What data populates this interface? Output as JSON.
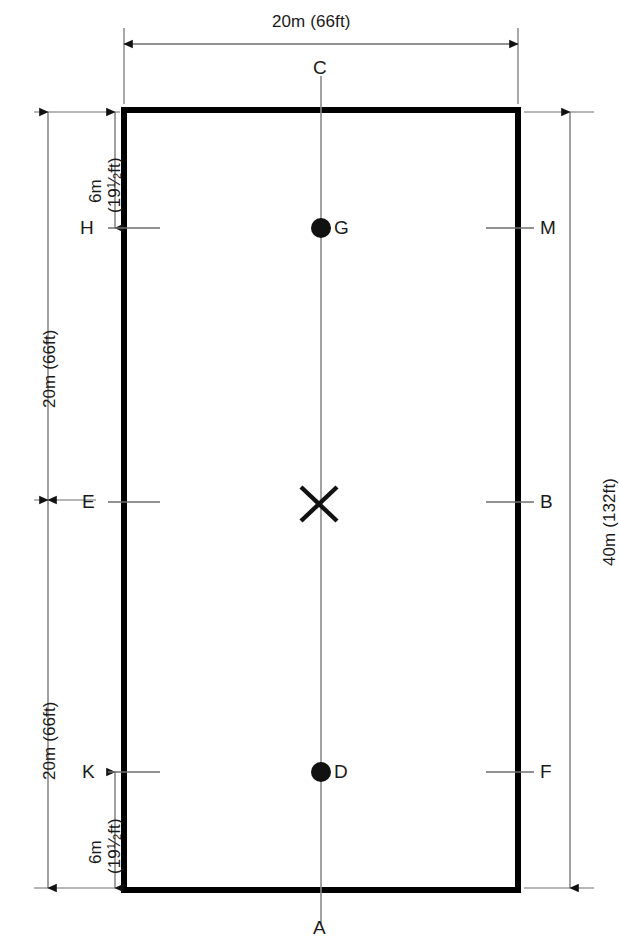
{
  "diagram": {
    "type": "dressage-arena-plan",
    "arena": {
      "width_label": "20m (66ft)",
      "height_label": "40m (132ft)"
    },
    "dimensions": {
      "top_width": "20m (66ft)",
      "right_height": "40m (132ft)",
      "upper_half": "20m (66ft)",
      "lower_half": "20m (66ft)",
      "top_inset_m": "6m",
      "top_inset_ft": "(19½ft)",
      "bottom_inset_m": "6m",
      "bottom_inset_ft": "(19½ft)"
    },
    "markers": {
      "top_center": "C",
      "bottom_center": "A",
      "left_upper": "H",
      "right_upper": "M",
      "left_middle": "E",
      "right_middle": "B",
      "left_lower": "K",
      "right_lower": "F",
      "center_cross": "X",
      "dot_upper": "G",
      "dot_lower": "D"
    },
    "colors": {
      "arena_border": "#000000",
      "centerline": "#8a8a8a",
      "dimension_line": "#6e6e6e",
      "marker_tick": "#6e6e6e",
      "text": "#1a1a1a",
      "background": "#ffffff"
    }
  }
}
